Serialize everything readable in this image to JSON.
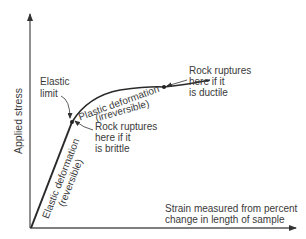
{
  "diagram": {
    "y_axis_label": "Applied stress",
    "x_axis_label_line1": "Strain measured from percent",
    "x_axis_label_line2": "change in length of sample",
    "elastic_limit_line1": "Elastic",
    "elastic_limit_line2": "limit",
    "elastic_region_line1": "Elastic deformation",
    "elastic_region_line2": "(reversible)",
    "plastic_region_line1": "Plastic deformation",
    "plastic_region_line2": "(irreversible)",
    "brittle_line1": "Rock ruptures",
    "brittle_line2": "here if it",
    "brittle_line3": "is brittle",
    "ductile_line1": "Rock ruptures",
    "ductile_line2": "here if it",
    "ductile_line3": "is ductile",
    "colors": {
      "line": "#2a2a2a",
      "axis": "#555555",
      "text": "#3a3a3a"
    }
  }
}
